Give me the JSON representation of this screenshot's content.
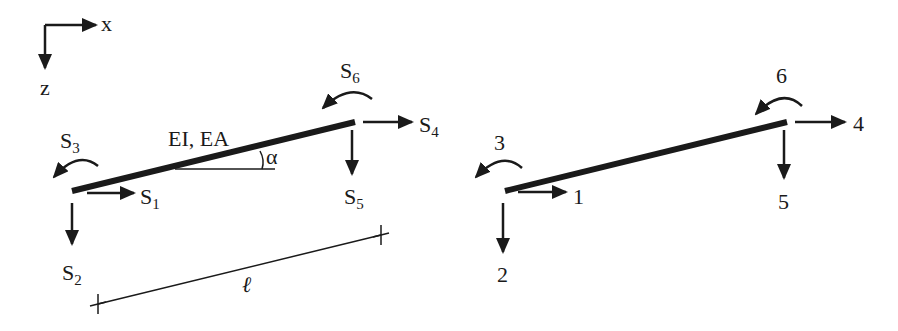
{
  "axes": {
    "x_label": "x",
    "z_label": "z"
  },
  "left_element": {
    "property_label": "EI, EA",
    "angle_label": "α",
    "length_label": "ℓ",
    "forces": [
      {
        "id": "S1",
        "base": "S",
        "sub": "1",
        "direction": "right",
        "node": "start"
      },
      {
        "id": "S2",
        "base": "S",
        "sub": "2",
        "direction": "down",
        "node": "start"
      },
      {
        "id": "S3",
        "base": "S",
        "sub": "3",
        "direction": "moment-ccw",
        "node": "start"
      },
      {
        "id": "S4",
        "base": "S",
        "sub": "4",
        "direction": "right",
        "node": "end"
      },
      {
        "id": "S5",
        "base": "S",
        "sub": "5",
        "direction": "down",
        "node": "end"
      },
      {
        "id": "S6",
        "base": "S",
        "sub": "6",
        "direction": "moment-ccw",
        "node": "end"
      }
    ]
  },
  "right_element": {
    "dofs": [
      {
        "id": "1",
        "label": "1",
        "direction": "right",
        "node": "start"
      },
      {
        "id": "2",
        "label": "2",
        "direction": "down",
        "node": "start"
      },
      {
        "id": "3",
        "label": "3",
        "direction": "moment-ccw",
        "node": "start"
      },
      {
        "id": "4",
        "label": "4",
        "direction": "right",
        "node": "end"
      },
      {
        "id": "5",
        "label": "5",
        "direction": "down",
        "node": "end"
      },
      {
        "id": "6",
        "label": "6",
        "direction": "moment-ccw",
        "node": "end"
      }
    ]
  },
  "colors": {
    "ink": "#1a1a1a",
    "background": "#ffffff"
  }
}
